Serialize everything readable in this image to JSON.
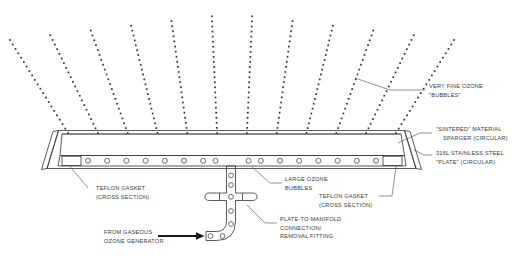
{
  "diagram": {
    "background_color": "#ffffff",
    "line_color": "#3d3d3d",
    "text_color": "#3a3a3a",
    "sinter_fill_color": "#d5d5d5",
    "plate_fill_color": "#ffffff",
    "gasket_fill_color": "#ffffff"
  },
  "callouts": {
    "very_fine_ozone_bubbles": {
      "line1": "VERY FINE OZONE",
      "line2": "\"BUBBLES\""
    },
    "sintered_material_sparger": {
      "line1": "\"SINTERED\" MATERIAL",
      "line2": "SPARGER (CIRCULAR)"
    },
    "stainless_steel_plate": {
      "line1": "316L STAINLESS STEEL",
      "line2": "\"PLATE\" (CIRCULAR)"
    },
    "teflon_gasket_left": {
      "line1": "TEFLON GASKET",
      "line2": "(CROSS SECTION)"
    },
    "teflon_gasket_right": {
      "line1": "TEFLON GASKET",
      "line2": "(CROSS SECTION)"
    },
    "large_ozone_bubbles": {
      "line1": "LARGE OZONE",
      "line2": "BUBBLES"
    },
    "plate_to_manifold_fitting": {
      "line1": "PLATE-TO-MANIFOLD",
      "line2": "CONNECTION/",
      "line3": "REMOVAL FITTING"
    },
    "gas_inlet": {
      "line1": "FROM GASEOUS",
      "line2": "OZONE GENERATOR"
    }
  },
  "components": {
    "sintered_sparger_label": "sintered-sparger-layer",
    "steel_plate_label": "stainless-steel-plate",
    "gasket_left_label": "teflon-gasket-left",
    "gasket_right_label": "teflon-gasket-right",
    "manifold_label": "gas-manifold-pipe",
    "cross_fitting_label": "cross-union-fitting",
    "elbow_label": "elbow-fitting",
    "inlet_arrow_label": "gas-inlet-arrow"
  },
  "geometry": {
    "plate_hole_count": 16,
    "bubble_stream_count": 12,
    "manifold_bolt_hole_count": 4,
    "elbow_bolt_hole_count": 3
  }
}
